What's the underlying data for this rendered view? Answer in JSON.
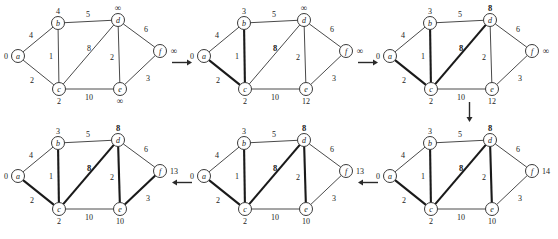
{
  "figure": {
    "type": "diagram",
    "node_ids": [
      "a",
      "b",
      "c",
      "d",
      "e",
      "f"
    ],
    "node_positions": {
      "a": {
        "x": 18,
        "y": 56
      },
      "b": {
        "x": 58,
        "y": 23
      },
      "c": {
        "x": 59,
        "y": 89
      },
      "d": {
        "x": 118,
        "y": 20
      },
      "e": {
        "x": 120,
        "y": 89
      },
      "f": {
        "x": 160,
        "y": 51
      }
    },
    "edges": [
      {
        "from": "a",
        "to": "b",
        "weight": "4",
        "label_x": 31,
        "label_y": 35
      },
      {
        "from": "a",
        "to": "c",
        "weight": "2",
        "label_x": 32,
        "label_y": 80
      },
      {
        "from": "b",
        "to": "c",
        "weight": "1",
        "label_x": 51,
        "label_y": 56
      },
      {
        "from": "b",
        "to": "d",
        "weight": "5",
        "label_x": 88,
        "label_y": 14
      },
      {
        "from": "c",
        "to": "d",
        "weight": "8",
        "label_x": 89,
        "label_y": 48
      },
      {
        "from": "c",
        "to": "e",
        "weight": "10",
        "label_x": 89,
        "label_y": 97
      },
      {
        "from": "d",
        "to": "e",
        "weight": "2",
        "label_x": 112,
        "label_y": 57
      },
      {
        "from": "d",
        "to": "f",
        "weight": "6",
        "label_x": 146,
        "label_y": 29
      },
      {
        "from": "e",
        "to": "f",
        "weight": "3",
        "label_x": 148,
        "label_y": 78
      }
    ],
    "label_offsets": {
      "a": {
        "x": -12,
        "y": 0
      },
      "b": {
        "x": 0,
        "y": -12
      },
      "c": {
        "x": 0,
        "y": 12
      },
      "d": {
        "x": 0,
        "y": -12
      },
      "e": {
        "x": 0,
        "y": 12
      },
      "f": {
        "x": 14,
        "y": 0
      }
    }
  },
  "panels": [
    {
      "id": "step-1",
      "position": {
        "x": 0,
        "y": 0
      },
      "distances": {
        "a": "0",
        "b": "4",
        "c": "2",
        "d": "∞",
        "e": "∞",
        "f": "∞"
      },
      "bold_distances": [],
      "bold_edges": [],
      "bold_weights": []
    },
    {
      "id": "step-2",
      "position": {
        "x": 186,
        "y": 0
      },
      "distances": {
        "a": "0",
        "b": "3",
        "c": "2",
        "d": "∞",
        "e": "12",
        "f": "∞"
      },
      "bold_distances": [],
      "bold_edges": [
        "a-c",
        "b-c"
      ],
      "bold_weights": [
        "c-d"
      ]
    },
    {
      "id": "step-3",
      "position": {
        "x": 372,
        "y": 0
      },
      "distances": {
        "a": "0",
        "b": "3",
        "c": "2",
        "d": "8",
        "e": "12",
        "f": "∞"
      },
      "bold_distances": [
        "d"
      ],
      "bold_edges": [
        "a-c",
        "b-c",
        "c-d"
      ],
      "bold_weights": [
        "c-d"
      ]
    },
    {
      "id": "step-4",
      "position": {
        "x": 372,
        "y": 120
      },
      "distances": {
        "a": "0",
        "b": "3",
        "c": "2",
        "d": "8",
        "e": "10",
        "f": "14"
      },
      "bold_distances": [
        "d"
      ],
      "bold_edges": [
        "a-c",
        "b-c",
        "c-d",
        "d-e"
      ],
      "bold_weights": [
        "c-d"
      ]
    },
    {
      "id": "step-5",
      "position": {
        "x": 186,
        "y": 120
      },
      "distances": {
        "a": "0",
        "b": "3",
        "c": "2",
        "d": "8",
        "e": "10",
        "f": "13"
      },
      "bold_distances": [
        "d"
      ],
      "bold_edges": [
        "a-c",
        "b-c",
        "c-d",
        "d-e"
      ],
      "bold_weights": [
        "c-d"
      ]
    },
    {
      "id": "step-6",
      "position": {
        "x": 0,
        "y": 120
      },
      "distances": {
        "a": "0",
        "b": "3",
        "c": "2",
        "d": "8",
        "e": "10",
        "f": "13"
      },
      "bold_distances": [
        "d"
      ],
      "bold_edges": [
        "a-c",
        "b-c",
        "c-d",
        "d-e",
        "e-f"
      ],
      "bold_weights": [
        "c-d"
      ]
    }
  ],
  "arrows": [
    {
      "id": "arrow-1-to-2",
      "direction": "right",
      "x": 172,
      "y": 58,
      "length": 20
    },
    {
      "id": "arrow-2-to-3",
      "direction": "right",
      "x": 358,
      "y": 58,
      "length": 20
    },
    {
      "id": "arrow-3-to-4",
      "direction": "down",
      "x": 465,
      "y": 102,
      "length": 20
    },
    {
      "id": "arrow-4-to-5",
      "direction": "left",
      "x": 358,
      "y": 178,
      "length": 20
    },
    {
      "id": "arrow-5-to-6",
      "direction": "left",
      "x": 172,
      "y": 178,
      "length": 20
    }
  ]
}
